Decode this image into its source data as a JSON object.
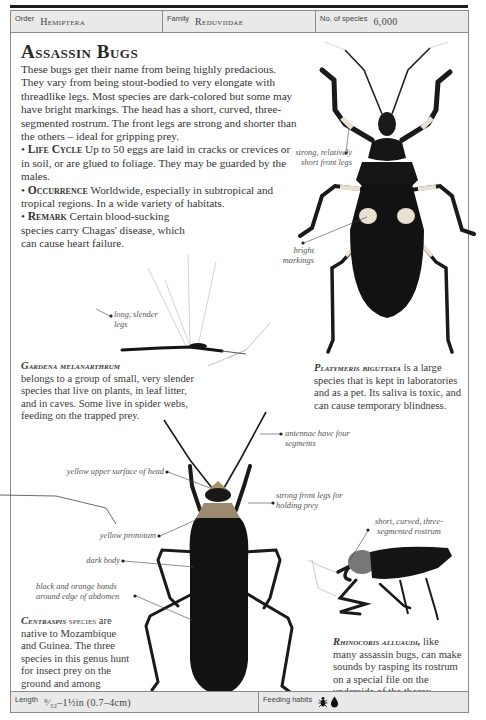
{
  "header": {
    "order_label": "Order",
    "order_value": "Hemiptera",
    "family_label": "Family",
    "family_value": "Reduviidae",
    "species_label": "No. of species",
    "species_value": "6,000"
  },
  "main": {
    "title": "Assassin Bugs",
    "intro": "These bugs get their name from being highly predacious. They vary from being stout-bodied to very elongate with threadlike legs. Most species are dark-colored but some may have bright markings. The head has a short, curved, three-segmented rostrum. The front legs are strong and shorter than the others – ideal for gripping prey.",
    "sections": [
      {
        "heading": "Life Cycle",
        "text": "Up to 50 eggs are laid in cracks or crevices or in soil, or are glued to foliage. They may be guarded by the males."
      },
      {
        "heading": "Occurrence",
        "text": "Worldwide, especially in subtropical and tropical regions. In a wide variety of habitats."
      },
      {
        "heading": "Remark",
        "text": "Certain blood-sucking species carry Chagas' disease, which can cause heart failure."
      }
    ]
  },
  "specimens": {
    "platymeris": {
      "name": "Platymeris biguttata",
      "caption": "is a large species that is kept in laboratories and as a pet. Its saliva is toxic, and can cause temporary blindness.",
      "labels": [
        "strong, relatively short front legs",
        "bright markings"
      ]
    },
    "gardena": {
      "name": "Gardena melanarthrum",
      "caption": "belongs to a group of small, very slender species that live on plants, in leaf litter, and in caves. Some live in spider webs, feeding on the trapped prey.",
      "labels": [
        "long, slender legs"
      ]
    },
    "centraspis": {
      "name": "Centraspis",
      "name_suffix": "species",
      "caption": "are native to Mozambique and Guinea. The three species in this genus hunt for insect prey on the ground and among vegetation.",
      "labels": [
        "antennae have four segments",
        "yellow upper surface of head",
        "strong front legs for holding prey",
        "yellow pronotum",
        "dark body",
        "black and orange bands around edge of abdomen"
      ]
    },
    "rhinocoris": {
      "name": "Rhinocoris alluaudi,",
      "caption": "like many assassin bugs, can make sounds by rasping its rostrum on a special file on the underside of the thorax.",
      "labels": [
        "short, curved, three-segmented rostrum"
      ]
    }
  },
  "footer": {
    "length_label": "Length",
    "length_value": "⁹⁄₃₂–1½in (0.7–4cm)",
    "feeding_label": "Feeding habits",
    "feeding_icons": [
      "insect-prey-icon",
      "blood-drop-icon"
    ]
  },
  "colors": {
    "header_bg": "#e9e9e9",
    "border": "#8a8a8a",
    "bug_dark": "#141414",
    "marking_cream": "#e8e0d0",
    "pronotum_tan": "#9c8a70"
  }
}
